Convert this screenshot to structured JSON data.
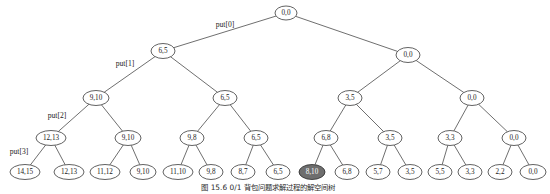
{
  "figure": {
    "caption": "图 15.6  0/1 背包问题求解过程的解空间树",
    "caption_x": 268,
    "caption_y": 188,
    "node_fill": "#ffffff",
    "node_stroke": "#3a3a3a",
    "highlight_fill": "#6e6e6e",
    "edge_color": "#4a4a4a",
    "background": "#ffffff"
  },
  "tree": {
    "type": "binary-tree",
    "levels": 5,
    "node_rx": 12,
    "node_ry": 7.5,
    "leaf_rx": 13,
    "leaf_ry": 7.5,
    "nodes": [
      {
        "id": "n0",
        "label": "0,0",
        "x": 286,
        "y": 13,
        "rx": 11,
        "ry": 7,
        "highlight": false,
        "level": 0
      },
      {
        "id": "n1",
        "label": "6,5",
        "x": 163,
        "y": 51,
        "rx": 12,
        "ry": 7.5,
        "highlight": false,
        "level": 1
      },
      {
        "id": "n2",
        "label": "0,0",
        "x": 408,
        "y": 55,
        "rx": 12,
        "ry": 7.5,
        "highlight": false,
        "level": 1
      },
      {
        "id": "n3",
        "label": "9,10",
        "x": 96,
        "y": 98,
        "rx": 13,
        "ry": 7.5,
        "highlight": false,
        "level": 2
      },
      {
        "id": "n4",
        "label": "6,5",
        "x": 225,
        "y": 98,
        "rx": 12,
        "ry": 7.5,
        "highlight": false,
        "level": 2
      },
      {
        "id": "n5",
        "label": "3,5",
        "x": 350,
        "y": 98,
        "rx": 12,
        "ry": 7.5,
        "highlight": false,
        "level": 2
      },
      {
        "id": "n6",
        "label": "0,0",
        "x": 472,
        "y": 98,
        "rx": 12,
        "ry": 7.5,
        "highlight": false,
        "level": 2
      },
      {
        "id": "n7",
        "label": "12,13",
        "x": 51,
        "y": 138,
        "rx": 15,
        "ry": 7.5,
        "highlight": false,
        "level": 3
      },
      {
        "id": "n8",
        "label": "9,10",
        "x": 128,
        "y": 138,
        "rx": 13,
        "ry": 7.5,
        "highlight": false,
        "level": 3
      },
      {
        "id": "n9",
        "label": "9,8",
        "x": 192,
        "y": 138,
        "rx": 12,
        "ry": 7.5,
        "highlight": false,
        "level": 3
      },
      {
        "id": "n10",
        "label": "6,5",
        "x": 256,
        "y": 138,
        "rx": 12,
        "ry": 7.5,
        "highlight": false,
        "level": 3
      },
      {
        "id": "n11",
        "label": "6,8",
        "x": 326,
        "y": 138,
        "rx": 12,
        "ry": 7.5,
        "highlight": false,
        "level": 3
      },
      {
        "id": "n12",
        "label": "3,5",
        "x": 390,
        "y": 138,
        "rx": 12,
        "ry": 7.5,
        "highlight": false,
        "level": 3
      },
      {
        "id": "n13",
        "label": "3,3",
        "x": 450,
        "y": 138,
        "rx": 12,
        "ry": 7.5,
        "highlight": false,
        "level": 3
      },
      {
        "id": "n14",
        "label": "0,0",
        "x": 514,
        "y": 138,
        "rx": 12,
        "ry": 7.5,
        "highlight": false,
        "level": 3
      },
      {
        "id": "l0",
        "label": "14,15",
        "x": 25,
        "y": 172,
        "rx": 15,
        "ry": 7.5,
        "highlight": false,
        "level": 4
      },
      {
        "id": "l1",
        "label": "12,13",
        "x": 69,
        "y": 172,
        "rx": 15,
        "ry": 7.5,
        "highlight": false,
        "level": 4
      },
      {
        "id": "l2",
        "label": "11,12",
        "x": 105,
        "y": 172,
        "rx": 15,
        "ry": 7.5,
        "highlight": false,
        "level": 4
      },
      {
        "id": "l3",
        "label": "9,10",
        "x": 143,
        "y": 172,
        "rx": 13,
        "ry": 7.5,
        "highlight": false,
        "level": 4
      },
      {
        "id": "l4",
        "label": "11,10",
        "x": 178,
        "y": 172,
        "rx": 15,
        "ry": 7.5,
        "highlight": false,
        "level": 4
      },
      {
        "id": "l5",
        "label": "9,8",
        "x": 211,
        "y": 172,
        "rx": 12,
        "ry": 7.5,
        "highlight": false,
        "level": 4
      },
      {
        "id": "l6",
        "label": "8,7",
        "x": 243,
        "y": 172,
        "rx": 12,
        "ry": 7.5,
        "highlight": false,
        "level": 4
      },
      {
        "id": "l7",
        "label": "6,5",
        "x": 278,
        "y": 172,
        "rx": 12,
        "ry": 7.5,
        "highlight": false,
        "level": 4
      },
      {
        "id": "l8",
        "label": "8,10",
        "x": 312,
        "y": 172,
        "rx": 13,
        "ry": 7.5,
        "highlight": true,
        "level": 4
      },
      {
        "id": "l9",
        "label": "6,8",
        "x": 347,
        "y": 172,
        "rx": 12,
        "ry": 7.5,
        "highlight": false,
        "level": 4
      },
      {
        "id": "l10",
        "label": "5,7",
        "x": 378,
        "y": 172,
        "rx": 12,
        "ry": 7.5,
        "highlight": false,
        "level": 4
      },
      {
        "id": "l11",
        "label": "3,5",
        "x": 410,
        "y": 172,
        "rx": 12,
        "ry": 7.5,
        "highlight": false,
        "level": 4
      },
      {
        "id": "l12",
        "label": "5,5",
        "x": 440,
        "y": 172,
        "rx": 12,
        "ry": 7.5,
        "highlight": false,
        "level": 4
      },
      {
        "id": "l13",
        "label": "3,3",
        "x": 470,
        "y": 172,
        "rx": 12,
        "ry": 7.5,
        "highlight": false,
        "level": 4
      },
      {
        "id": "l14",
        "label": "2,2",
        "x": 500,
        "y": 172,
        "rx": 12,
        "ry": 7.5,
        "highlight": false,
        "level": 4
      },
      {
        "id": "l15",
        "label": "0,0",
        "x": 533,
        "y": 172,
        "rx": 13,
        "ry": 7.5,
        "highlight": false,
        "level": 4
      }
    ],
    "edges": [
      {
        "from": "n0",
        "to": "n1"
      },
      {
        "from": "n0",
        "to": "n2"
      },
      {
        "from": "n1",
        "to": "n3"
      },
      {
        "from": "n1",
        "to": "n4"
      },
      {
        "from": "n2",
        "to": "n5"
      },
      {
        "from": "n2",
        "to": "n6"
      },
      {
        "from": "n3",
        "to": "n7"
      },
      {
        "from": "n3",
        "to": "n8"
      },
      {
        "from": "n4",
        "to": "n9"
      },
      {
        "from": "n4",
        "to": "n10"
      },
      {
        "from": "n5",
        "to": "n11"
      },
      {
        "from": "n5",
        "to": "n12"
      },
      {
        "from": "n6",
        "to": "n13"
      },
      {
        "from": "n6",
        "to": "n14"
      },
      {
        "from": "n7",
        "to": "l0"
      },
      {
        "from": "n7",
        "to": "l1"
      },
      {
        "from": "n8",
        "to": "l2"
      },
      {
        "from": "n8",
        "to": "l3"
      },
      {
        "from": "n9",
        "to": "l4"
      },
      {
        "from": "n9",
        "to": "l5"
      },
      {
        "from": "n10",
        "to": "l6"
      },
      {
        "from": "n10",
        "to": "l7"
      },
      {
        "from": "n11",
        "to": "l8"
      },
      {
        "from": "n11",
        "to": "l9"
      },
      {
        "from": "n12",
        "to": "l10"
      },
      {
        "from": "n12",
        "to": "l11"
      },
      {
        "from": "n13",
        "to": "l12"
      },
      {
        "from": "n13",
        "to": "l13"
      },
      {
        "from": "n14",
        "to": "l14"
      },
      {
        "from": "n14",
        "to": "l15"
      }
    ],
    "edge_labels": [
      {
        "id": "put0",
        "text": "put[0]",
        "x": 225,
        "y": 25
      },
      {
        "id": "put1",
        "text": "put[1]",
        "x": 125,
        "y": 64
      },
      {
        "id": "put2",
        "text": "put[2]",
        "x": 57,
        "y": 116
      },
      {
        "id": "put3",
        "text": "put[3]",
        "x": 19,
        "y": 152
      }
    ]
  }
}
